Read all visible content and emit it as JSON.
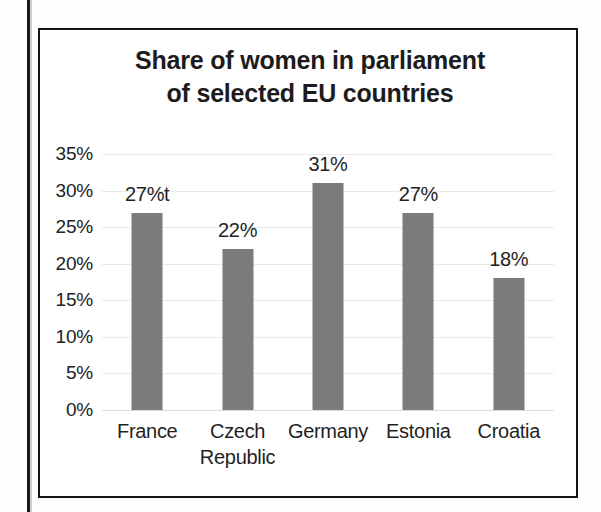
{
  "figure": {
    "title_lines": [
      "Share of women in parliament",
      "of selected EU countries"
    ],
    "bar_color": "#7b7b7b",
    "text_color": "#1f1f1f",
    "gridline_color": "#e9e9e9",
    "frame_color": "#141414"
  },
  "chart_data": {
    "type": "bar",
    "title": "Share of women in parliament of selected EU countries",
    "xlabel": "",
    "ylabel": "",
    "categories": [
      "France",
      "Czech Republic",
      "Germany",
      "Estonia",
      "Croatia"
    ],
    "category_lines": [
      [
        "France"
      ],
      [
        "Czech",
        "Republic"
      ],
      [
        "Germany"
      ],
      [
        "Estonia"
      ],
      [
        "Croatia"
      ]
    ],
    "values": [
      27,
      22,
      31,
      27,
      18
    ],
    "data_labels": [
      "27%t",
      "22%",
      "31%",
      "27%",
      "18%"
    ],
    "ylim": [
      0,
      35
    ],
    "ytick_values": [
      0,
      5,
      10,
      15,
      20,
      25,
      30,
      35
    ],
    "ytick_labels": [
      "0%",
      "5%",
      "10%",
      "15%",
      "20%",
      "25%",
      "30%",
      "35%"
    ],
    "grid": true,
    "legend": "none",
    "units": "percent"
  }
}
